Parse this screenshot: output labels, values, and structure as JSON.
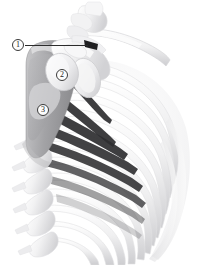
{
  "figure": {
    "style": "grayscale medical illustration",
    "width": 204,
    "height": 265,
    "background_color": "#ffffff"
  },
  "callouts": [
    {
      "id": "callout-1",
      "label": "1",
      "x": 12,
      "y": 39,
      "has_leader_line": true,
      "leader_from_x": 25,
      "leader_to_x": 88,
      "leader_y": 45
    },
    {
      "id": "callout-2",
      "label": "2",
      "x": 56,
      "y": 69,
      "has_leader_line": false
    },
    {
      "id": "callout-3",
      "label": "3",
      "x": 37,
      "y": 104,
      "has_leader_line": false
    }
  ],
  "colors": {
    "background": "#ffffff",
    "bone_light": "#f4f4f5",
    "bone_mid": "#dcdcde",
    "bone_shade": "#c4c4c7",
    "muscle_gray": "#a8a8aa",
    "muscle_gray_dark": "#8f8f92",
    "dark_band": "#2e2e30",
    "outline": "#3a3a3a",
    "callout_fill": "#fdfdfd",
    "callout_text": "#1a1a1a"
  },
  "structures": {
    "clavicle": "clavicle",
    "scapula": "scapula",
    "humeral_head": "humeral head",
    "glenoid": "glenoid cavity",
    "ribs": "ribs",
    "vertebrae": "thoracic vertebrae",
    "intercostal_bands": "intercostal dark bands",
    "muscle_band": "shaded muscle band"
  }
}
